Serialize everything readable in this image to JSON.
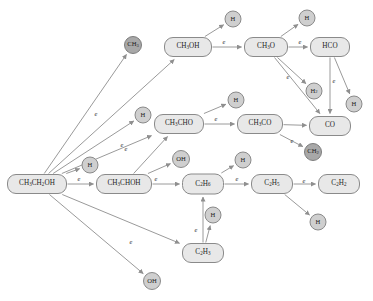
{
  "diagram": {
    "edge_label": "e",
    "colors": {
      "species_fill": "#e8e8e8",
      "radical_fill": "#cfcfcf",
      "radical_dark_fill": "#a8a8a8",
      "stroke": "#8a8a8a",
      "edge": "#9a9a9a",
      "text": "#1d1d1d"
    },
    "nodes": [
      {
        "id": "ethanol",
        "label": "CH₃CH₂OH",
        "kind": "species",
        "x": 37,
        "y": 184,
        "w": 60,
        "h": 20
      },
      {
        "id": "ch3oh",
        "label": "CH₃OH",
        "kind": "species",
        "x": 188,
        "y": 47,
        "w": 48,
        "h": 20
      },
      {
        "id": "ch3o",
        "label": "CH₃O",
        "kind": "species",
        "x": 266,
        "y": 47,
        "w": 44,
        "h": 20
      },
      {
        "id": "hco",
        "label": "HCO",
        "kind": "species",
        "x": 330,
        "y": 47,
        "w": 40,
        "h": 20
      },
      {
        "id": "co",
        "label": "CO",
        "kind": "species",
        "x": 330,
        "y": 126,
        "w": 42,
        "h": 20
      },
      {
        "id": "ch3cho",
        "label": "CH₃CHO",
        "kind": "species",
        "x": 179,
        "y": 124,
        "w": 50,
        "h": 20
      },
      {
        "id": "ch3co",
        "label": "CH₃CO",
        "kind": "species",
        "x": 260,
        "y": 124,
        "w": 46,
        "h": 20
      },
      {
        "id": "ch3choh",
        "label": "CH₃CHOH",
        "kind": "species",
        "x": 124,
        "y": 184,
        "w": 56,
        "h": 20
      },
      {
        "id": "c2h6",
        "label": "C₂H₆",
        "kind": "species",
        "x": 203,
        "y": 184,
        "w": 42,
        "h": 21
      },
      {
        "id": "c2h5",
        "label": "C₂H₅",
        "kind": "species",
        "x": 272,
        "y": 184,
        "w": 42,
        "h": 20
      },
      {
        "id": "c2h2",
        "label": "C₂H₂",
        "kind": "species",
        "x": 339,
        "y": 184,
        "w": 42,
        "h": 20
      },
      {
        "id": "c2h3",
        "label": "C₂H₃",
        "kind": "species",
        "x": 203,
        "y": 253,
        "w": 42,
        "h": 20
      },
      {
        "id": "ch3_rad",
        "label": "CH₃",
        "kind": "radical-dark",
        "x": 133,
        "y": 45,
        "w": 18,
        "h": 18
      },
      {
        "id": "h_top1",
        "label": "H",
        "kind": "radical",
        "x": 233,
        "y": 19,
        "w": 17,
        "h": 17
      },
      {
        "id": "h_top2",
        "label": "H",
        "kind": "radical",
        "x": 307,
        "y": 18,
        "w": 17,
        "h": 17
      },
      {
        "id": "h2_mid",
        "label": "H₂",
        "kind": "radical",
        "x": 314,
        "y": 91,
        "w": 17,
        "h": 17
      },
      {
        "id": "h_right",
        "label": "H",
        "kind": "radical",
        "x": 354,
        "y": 104,
        "w": 17,
        "h": 17
      },
      {
        "id": "ch2_rad",
        "label": "CH₂",
        "kind": "radical-dark",
        "x": 313,
        "y": 152,
        "w": 18,
        "h": 18
      },
      {
        "id": "h_mid1",
        "label": "H",
        "kind": "radical",
        "x": 143,
        "y": 115,
        "w": 17,
        "h": 17
      },
      {
        "id": "h_mid2",
        "label": "H",
        "kind": "radical",
        "x": 236,
        "y": 100,
        "w": 17,
        "h": 17
      },
      {
        "id": "h_low1",
        "label": "H",
        "kind": "radical",
        "x": 90,
        "y": 165,
        "w": 17,
        "h": 17
      },
      {
        "id": "oh_mid",
        "label": "OH",
        "kind": "radical",
        "x": 181,
        "y": 159,
        "w": 18,
        "h": 18
      },
      {
        "id": "h_low2",
        "label": "H",
        "kind": "radical",
        "x": 243,
        "y": 160,
        "w": 17,
        "h": 17
      },
      {
        "id": "h_low3",
        "label": "H",
        "kind": "radical",
        "x": 213,
        "y": 215,
        "w": 17,
        "h": 17
      },
      {
        "id": "h_bot",
        "label": "H",
        "kind": "radical",
        "x": 318,
        "y": 222,
        "w": 17,
        "h": 17
      },
      {
        "id": "oh_bot",
        "label": "OH",
        "kind": "radical",
        "x": 152,
        "y": 281,
        "w": 18,
        "h": 18
      }
    ],
    "edges": [
      {
        "from": "ethanol",
        "to": "ch3oh",
        "label": "e",
        "lx": 96,
        "ly": 113
      },
      {
        "from": "ethanol",
        "to": "ch3_rad",
        "label": "",
        "lx": 0,
        "ly": 0
      },
      {
        "from": "ethanol",
        "to": "ch3cho",
        "label": "e",
        "lx": 122,
        "ly": 144
      },
      {
        "from": "ethanol",
        "to": "h_mid1",
        "label": "",
        "lx": 0,
        "ly": 0
      },
      {
        "from": "ethanol",
        "to": "ch3choh",
        "label": "e",
        "lx": 79,
        "ly": 178
      },
      {
        "from": "ethanol",
        "to": "h_low1",
        "label": "",
        "lx": 0,
        "ly": 0
      },
      {
        "from": "ethanol",
        "to": "c2h3",
        "label": "e",
        "lx": 131,
        "ly": 241
      },
      {
        "from": "ethanol",
        "to": "oh_bot",
        "label": "",
        "lx": 0,
        "ly": 0
      },
      {
        "from": "ch3oh",
        "to": "ch3o",
        "label": "e",
        "lx": 224,
        "ly": 41
      },
      {
        "from": "ch3oh",
        "to": "h_top1",
        "label": "",
        "lx": 0,
        "ly": 0
      },
      {
        "from": "ch3o",
        "to": "hco",
        "label": "e",
        "lx": 300,
        "ly": 41
      },
      {
        "from": "ch3o",
        "to": "h_top2",
        "label": "",
        "lx": 0,
        "ly": 0
      },
      {
        "from": "ch3o",
        "to": "h2_mid",
        "label": "e",
        "lx": 288,
        "ly": 76
      },
      {
        "from": "ch3o",
        "to": "co",
        "label": "",
        "lx": 0,
        "ly": 0
      },
      {
        "from": "hco",
        "to": "co",
        "label": "e",
        "lx": 334,
        "ly": 80
      },
      {
        "from": "hco",
        "to": "h_right",
        "label": "",
        "lx": 0,
        "ly": 0
      },
      {
        "from": "ch3cho",
        "to": "ch3co",
        "label": "e",
        "lx": 216,
        "ly": 118
      },
      {
        "from": "ch3cho",
        "to": "h_mid2",
        "label": "",
        "lx": 0,
        "ly": 0
      },
      {
        "from": "ch3co",
        "to": "co",
        "label": "e",
        "lx": 292,
        "ly": 140
      },
      {
        "from": "ch3co",
        "to": "ch2_rad",
        "label": "",
        "lx": 0,
        "ly": 0
      },
      {
        "from": "ch3choh",
        "to": "c2h6",
        "label": "e",
        "lx": 156,
        "ly": 178
      },
      {
        "from": "ch3choh",
        "to": "oh_mid",
        "label": "",
        "lx": 0,
        "ly": 0
      },
      {
        "from": "ch3choh",
        "to": "ch3cho",
        "label": "e",
        "lx": 126,
        "ly": 148
      },
      {
        "from": "c2h6",
        "to": "c2h5",
        "label": "e",
        "lx": 237,
        "ly": 178
      },
      {
        "from": "c2h6",
        "to": "h_low2",
        "label": "",
        "lx": 0,
        "ly": 0
      },
      {
        "from": "c2h5",
        "to": "c2h2",
        "label": "e",
        "lx": 304,
        "ly": 180
      },
      {
        "from": "c2h5",
        "to": "h_bot",
        "label": "",
        "lx": 0,
        "ly": 0
      },
      {
        "from": "c2h3",
        "to": "c2h6",
        "label": "e",
        "lx": 196,
        "ly": 229
      },
      {
        "from": "c2h3",
        "to": "h_low3",
        "label": "",
        "lx": 0,
        "ly": 0
      }
    ]
  }
}
